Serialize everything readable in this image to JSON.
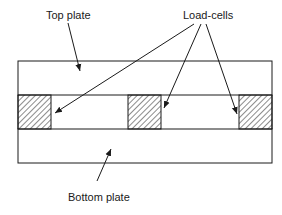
{
  "diagram": {
    "labels": {
      "top_plate": "Top plate",
      "load_cells": "Load-cells",
      "bottom_plate": "Bottom plate"
    },
    "components": [
      {
        "name": "Top plate",
        "role": "upper rigid plate"
      },
      {
        "name": "Load-cell (left)",
        "style": "hatched"
      },
      {
        "name": "Load-cell (middle)",
        "style": "hatched"
      },
      {
        "name": "Load-cell (right)",
        "style": "hatched"
      },
      {
        "name": "Bottom plate",
        "role": "lower rigid plate"
      }
    ],
    "colors": {
      "ink": "#1a1a1a",
      "background": "#ffffff"
    }
  }
}
